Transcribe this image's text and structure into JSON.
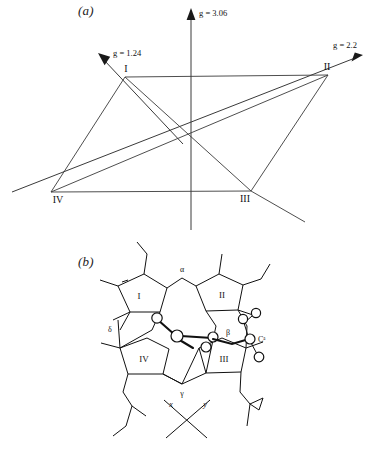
{
  "figure": {
    "panels": [
      {
        "id": "a",
        "letter": "(a)",
        "type": "g-tensor-axes",
        "axes": [
          {
            "name": "g-axis-vertical",
            "label": "g = 3.06",
            "value": 3.06
          },
          {
            "name": "g-axis-upper-left",
            "label": "g = 1.24",
            "value": 1.24
          },
          {
            "name": "g-axis-right",
            "label": "g = 2.2",
            "value": 2.2
          }
        ],
        "vertices": [
          {
            "name": "vertex-I",
            "label": "I"
          },
          {
            "name": "vertex-II",
            "label": "II"
          },
          {
            "name": "vertex-III",
            "label": "III"
          },
          {
            "name": "vertex-IV",
            "label": "IV"
          }
        ]
      },
      {
        "id": "b",
        "letter": "(b)",
        "type": "heme-structure",
        "rings": [
          {
            "name": "pyrrole-ring-I",
            "label": "I"
          },
          {
            "name": "pyrrole-ring-II",
            "label": "II"
          },
          {
            "name": "pyrrole-ring-III",
            "label": "III"
          },
          {
            "name": "pyrrole-ring-IV",
            "label": "IV"
          }
        ],
        "meso_carbons": [
          {
            "name": "meso-alpha",
            "label": "α"
          },
          {
            "name": "meso-beta",
            "label": "β"
          },
          {
            "name": "meso-gamma",
            "label": "γ"
          },
          {
            "name": "meso-delta",
            "label": "δ"
          }
        ],
        "atom_labels": [
          {
            "name": "c-alpha-label",
            "label": "Cᵃ"
          }
        ],
        "molecular_axes": [
          {
            "name": "molecular-axis-x",
            "label": "x"
          },
          {
            "name": "molecular-axis-y",
            "label": "y"
          }
        ]
      }
    ]
  },
  "colors": {
    "ink": "#111111",
    "axis": "#3a3a3a",
    "background": "#ffffff"
  }
}
